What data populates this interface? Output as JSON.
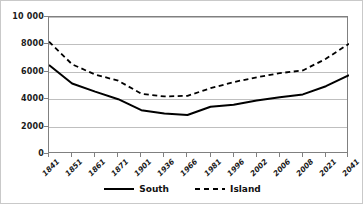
{
  "chart_data": {
    "type": "line",
    "title": "",
    "xlabel": "",
    "ylabel": "",
    "ylim": [
      0,
      10000
    ],
    "yticks": [
      "0",
      "2000",
      "4000",
      "6000",
      "8000",
      "10 000"
    ],
    "ytick_values": [
      0,
      2000,
      4000,
      6000,
      8000,
      10000
    ],
    "grid": true,
    "legend_position": "bottom",
    "categories": [
      "1841",
      "1851",
      "1861",
      "1871",
      "1901",
      "1936",
      "1966",
      "1981",
      "1996",
      "2002",
      "2006",
      "2008",
      "2021",
      "2041"
    ],
    "series": [
      {
        "name": "South",
        "style": "solid",
        "color": "#000000",
        "values": [
          6500,
          5150,
          4550,
          4000,
          3200,
          2950,
          2850,
          3450,
          3600,
          3900,
          4150,
          4350,
          4950,
          5750
        ]
      },
      {
        "name": "Island",
        "style": "dashed",
        "color": "#000000",
        "values": [
          8200,
          6550,
          5800,
          5350,
          4400,
          4200,
          4250,
          4800,
          5250,
          5600,
          5900,
          6100,
          6950,
          8050
        ]
      }
    ]
  },
  "legend": {
    "entries": [
      {
        "label": "South",
        "style": "solid"
      },
      {
        "label": "Island",
        "style": "dashed"
      }
    ]
  }
}
